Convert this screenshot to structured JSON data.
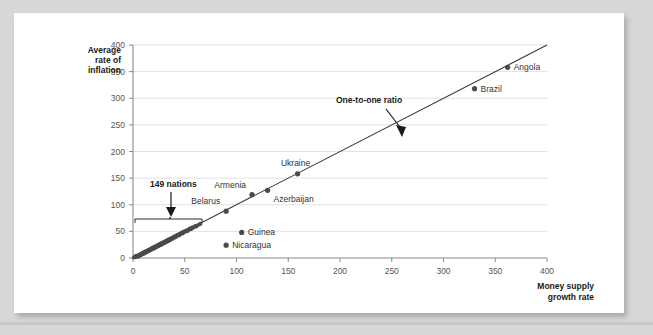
{
  "watermark": "",
  "chart_data": {
    "type": "scatter",
    "title": "",
    "xlabel": "Money supply growth rate",
    "ylabel": "Average rate of inflation",
    "xlim": [
      0,
      400
    ],
    "ylim": [
      0,
      400
    ],
    "xticks": [
      0,
      50,
      100,
      150,
      200,
      250,
      300,
      350,
      400
    ],
    "yticks": [
      0,
      50,
      100,
      150,
      200,
      250,
      300,
      350,
      400
    ],
    "xtick_labels": [
      "0",
      "50",
      "100",
      "150",
      "200",
      "250",
      "300",
      "350",
      "400"
    ],
    "ytick_labels": [
      "0",
      "50",
      "100",
      "150",
      "200",
      "250",
      "300",
      "350",
      "400"
    ],
    "grid": "horizontal",
    "legend": "none",
    "reference_line": {
      "name": "One-to-one ratio",
      "from": [
        0,
        0
      ],
      "to": [
        400,
        400
      ],
      "slope": 1,
      "intercept": 0
    },
    "labeled_points": [
      {
        "name": "Angola",
        "x": 362,
        "y": 358,
        "label_side": "right"
      },
      {
        "name": "Brazil",
        "x": 330,
        "y": 318,
        "label_side": "right"
      },
      {
        "name": "Ukraine",
        "x": 159,
        "y": 158,
        "label_side": "above"
      },
      {
        "name": "Azerbaijan",
        "x": 130,
        "y": 127,
        "label_side": "below-right"
      },
      {
        "name": "Armenia",
        "x": 115,
        "y": 119,
        "label_side": "above-left"
      },
      {
        "name": "Belarus",
        "x": 90,
        "y": 88,
        "label_side": "above-left"
      },
      {
        "name": "Guinea",
        "x": 105,
        "y": 48,
        "label_side": "right"
      },
      {
        "name": "Nicaragua",
        "x": 90,
        "y": 24,
        "label_side": "right"
      }
    ],
    "cluster_points": [
      {
        "x": 1,
        "y": 1
      },
      {
        "x": 2,
        "y": 2
      },
      {
        "x": 3,
        "y": 2
      },
      {
        "x": 3,
        "y": 4
      },
      {
        "x": 4,
        "y": 3
      },
      {
        "x": 5,
        "y": 5
      },
      {
        "x": 5,
        "y": 3
      },
      {
        "x": 6,
        "y": 6
      },
      {
        "x": 6,
        "y": 4
      },
      {
        "x": 7,
        "y": 7
      },
      {
        "x": 7,
        "y": 5
      },
      {
        "x": 8,
        "y": 8
      },
      {
        "x": 8,
        "y": 6
      },
      {
        "x": 9,
        "y": 9
      },
      {
        "x": 9,
        "y": 7
      },
      {
        "x": 10,
        "y": 10
      },
      {
        "x": 10,
        "y": 8
      },
      {
        "x": 11,
        "y": 11
      },
      {
        "x": 11,
        "y": 9
      },
      {
        "x": 12,
        "y": 12
      },
      {
        "x": 12,
        "y": 10
      },
      {
        "x": 13,
        "y": 13
      },
      {
        "x": 13,
        "y": 11
      },
      {
        "x": 14,
        "y": 14
      },
      {
        "x": 14,
        "y": 12
      },
      {
        "x": 15,
        "y": 15
      },
      {
        "x": 15,
        "y": 13
      },
      {
        "x": 16,
        "y": 16
      },
      {
        "x": 16,
        "y": 14
      },
      {
        "x": 17,
        "y": 17
      },
      {
        "x": 17,
        "y": 15
      },
      {
        "x": 18,
        "y": 18
      },
      {
        "x": 18,
        "y": 16
      },
      {
        "x": 19,
        "y": 19
      },
      {
        "x": 19,
        "y": 17
      },
      {
        "x": 20,
        "y": 20
      },
      {
        "x": 20,
        "y": 18
      },
      {
        "x": 21,
        "y": 21
      },
      {
        "x": 21,
        "y": 19
      },
      {
        "x": 22,
        "y": 22
      },
      {
        "x": 22,
        "y": 20
      },
      {
        "x": 23,
        "y": 23
      },
      {
        "x": 23,
        "y": 21
      },
      {
        "x": 24,
        "y": 24
      },
      {
        "x": 24,
        "y": 22
      },
      {
        "x": 25,
        "y": 25
      },
      {
        "x": 25,
        "y": 23
      },
      {
        "x": 26,
        "y": 26
      },
      {
        "x": 26,
        "y": 24
      },
      {
        "x": 27,
        "y": 27
      },
      {
        "x": 27,
        "y": 25
      },
      {
        "x": 28,
        "y": 28
      },
      {
        "x": 28,
        "y": 26
      },
      {
        "x": 29,
        "y": 29
      },
      {
        "x": 29,
        "y": 27
      },
      {
        "x": 30,
        "y": 30
      },
      {
        "x": 30,
        "y": 28
      },
      {
        "x": 31,
        "y": 31
      },
      {
        "x": 31,
        "y": 29
      },
      {
        "x": 32,
        "y": 32
      },
      {
        "x": 32,
        "y": 30
      },
      {
        "x": 33,
        "y": 33
      },
      {
        "x": 33,
        "y": 31
      },
      {
        "x": 34,
        "y": 34
      },
      {
        "x": 34,
        "y": 32
      },
      {
        "x": 35,
        "y": 35
      },
      {
        "x": 35,
        "y": 33
      },
      {
        "x": 36,
        "y": 36
      },
      {
        "x": 36,
        "y": 34
      },
      {
        "x": 37,
        "y": 37
      },
      {
        "x": 38,
        "y": 38
      },
      {
        "x": 38,
        "y": 36
      },
      {
        "x": 39,
        "y": 39
      },
      {
        "x": 40,
        "y": 40
      },
      {
        "x": 40,
        "y": 38
      },
      {
        "x": 41,
        "y": 41
      },
      {
        "x": 42,
        "y": 42
      },
      {
        "x": 42,
        "y": 40
      },
      {
        "x": 43,
        "y": 43
      },
      {
        "x": 44,
        "y": 44
      },
      {
        "x": 45,
        "y": 45
      },
      {
        "x": 45,
        "y": 43
      },
      {
        "x": 46,
        "y": 46
      },
      {
        "x": 47,
        "y": 47
      },
      {
        "x": 48,
        "y": 48
      },
      {
        "x": 48,
        "y": 46
      },
      {
        "x": 49,
        "y": 49
      },
      {
        "x": 50,
        "y": 50
      },
      {
        "x": 51,
        "y": 50
      },
      {
        "x": 52,
        "y": 52
      },
      {
        "x": 53,
        "y": 51
      },
      {
        "x": 54,
        "y": 54
      },
      {
        "x": 55,
        "y": 55
      },
      {
        "x": 56,
        "y": 54
      },
      {
        "x": 57,
        "y": 57
      },
      {
        "x": 58,
        "y": 57
      },
      {
        "x": 60,
        "y": 60
      },
      {
        "x": 61,
        "y": 59
      },
      {
        "x": 63,
        "y": 62
      },
      {
        "x": 65,
        "y": 64
      }
    ],
    "annotations": [
      {
        "name": "149 nations",
        "text": "149 nations",
        "type": "brace-arrow",
        "range_x": [
          2,
          68
        ]
      },
      {
        "name": "One-to-one ratio",
        "text": "One-to-one ratio",
        "type": "arrow",
        "target": [
          243,
          249
        ]
      }
    ]
  }
}
